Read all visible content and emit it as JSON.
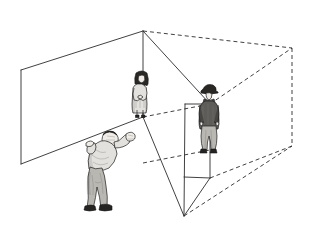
{
  "scene": {
    "title": "Line drawing of three people inside an open transparent rectangular room",
    "background_color": "#ffffff",
    "line_color": "#2b2b2b",
    "style": "pen-and-ink perspective diagram with pencil-shaded human figures"
  },
  "room": {
    "name": "transparent-rectangular-room",
    "description": "Wireframe cuboid drawn in two-point perspective; near half drawn with solid lines, far half with dashed hidden lines",
    "visible_edge_style": "solid",
    "hidden_edge_style": "dashed",
    "vertices": {
      "near_top_corner": [
        143,
        31
      ],
      "left_top_corner": [
        21,
        70
      ],
      "left_bottom_corner": [
        21,
        164
      ],
      "floor_back_corner": [
        143,
        117
      ],
      "front_bottom_corner": [
        184,
        216
      ],
      "right_panel_top": [
        210,
        104
      ],
      "right_panel_bottom": [
        210,
        178
      ],
      "far_top_corner": [
        292,
        48
      ],
      "far_bottom_corner": [
        292,
        146
      ]
    }
  },
  "figures": [
    {
      "id": "figure-foreground-man",
      "label": "Man bending forward with raised hands",
      "position": "front-left floor of the room",
      "pose": "leaning forward, both arms raised toward the center",
      "clothing": "light grey long-sleeve top and grey trousers",
      "hair": "light grey short hair",
      "shoes": "dark grey shoes",
      "approx_bbox": [
        68,
        128,
        60,
        87
      ]
    },
    {
      "id": "figure-center-woman",
      "label": "Woman in a pale coat standing at the back corner",
      "position": "back corner of the room, standing on the floor-corner line",
      "pose": "standing upright, hands crossed in front",
      "clothing": "white / pale long coat",
      "hair": "dark shoulder-length hair",
      "shoes": "dark shoes",
      "approx_bbox": [
        130,
        70,
        26,
        48
      ]
    },
    {
      "id": "figure-right-man",
      "label": "Man in dark jacket and hat standing by the right panel",
      "position": "right side of the room in front of the vertical panel",
      "pose": "standing, hands at sides, looking left",
      "clothing": "dark grey jacket, light trousers",
      "hair": "dark hat over dark hair",
      "shoes": "dark shoes",
      "approx_bbox": [
        198,
        84,
        28,
        70
      ]
    }
  ],
  "colors": {
    "ink": "#2b2b2b",
    "paper": "#ffffff",
    "light_cloth": "#e3e1dd",
    "mid_cloth": "#b9b7b2",
    "dark_cloth": "#5e5c59",
    "hair": "#2a2825",
    "shoe": "#262422"
  }
}
